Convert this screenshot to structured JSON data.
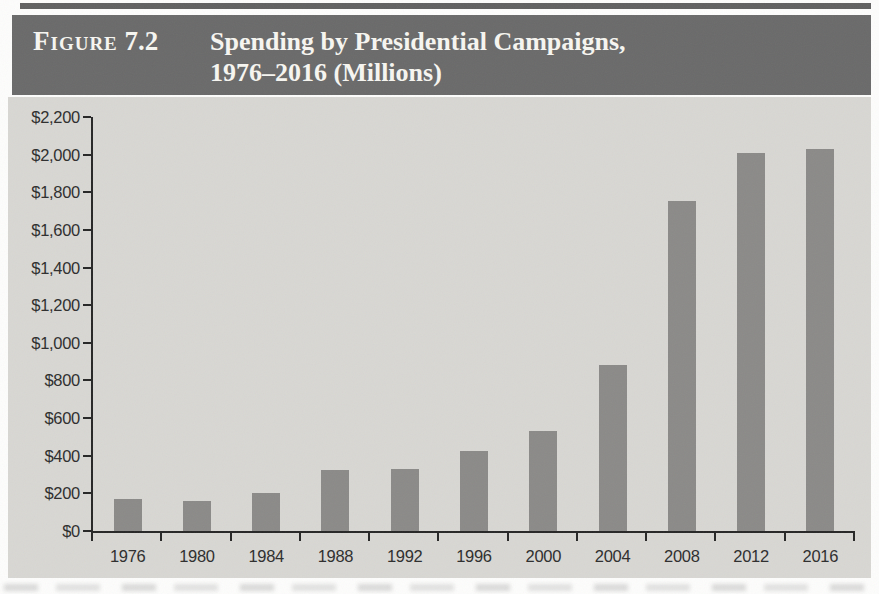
{
  "figure": {
    "label_prefix": "Figure",
    "number": "7.2",
    "title_line1": "Spending by Presidential Campaigns,",
    "title_line2": "1976–2016 (Millions)"
  },
  "chart_data": {
    "type": "bar",
    "title": "Spending by Presidential Campaigns, 1976–2016 (Millions)",
    "categories": [
      "1976",
      "1980",
      "1984",
      "1988",
      "1992",
      "1996",
      "2000",
      "2004",
      "2008",
      "2012",
      "2016"
    ],
    "values": [
      171,
      161,
      202,
      324,
      331,
      426,
      530,
      880,
      1755,
      2008,
      2030
    ],
    "xlabel": "",
    "ylabel": "",
    "ylim": [
      0,
      2200
    ],
    "ytick_step": 200,
    "ytick_labels": [
      "$0",
      "$200",
      "$400",
      "$600",
      "$800",
      "$1,000",
      "$1,200",
      "$1,400",
      "$1,600",
      "$1,800",
      "$2,000",
      "$2,200"
    ],
    "grid": false,
    "legend": false,
    "colors": {
      "bar": "#8b8a88",
      "plot_background": "#d8d7d3",
      "header_background": "#6a6a6a",
      "header_text": "#f7f6f1",
      "axis": "#262626",
      "tick_label": "#2d2d2d"
    }
  }
}
